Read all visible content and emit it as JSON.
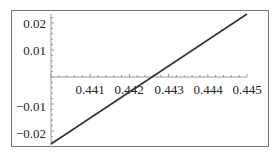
{
  "chart_data": {
    "type": "line",
    "title": "",
    "xlabel": "",
    "ylabel": "",
    "x_ticks": [
      "0.441",
      "0.442",
      "0.443",
      "0.444",
      "0.445"
    ],
    "y_ticks": [
      "0.02",
      "0.01",
      "-0.01",
      "-0.02"
    ],
    "xlim": [
      0.44,
      0.445
    ],
    "ylim": [
      -0.023,
      0.023
    ],
    "series": [
      {
        "name": "f(x)",
        "x": [
          0.44,
          0.445
        ],
        "y": [
          -0.0225,
          0.0225
        ]
      }
    ],
    "grid": false,
    "legend": null,
    "line_color": "#333333"
  }
}
